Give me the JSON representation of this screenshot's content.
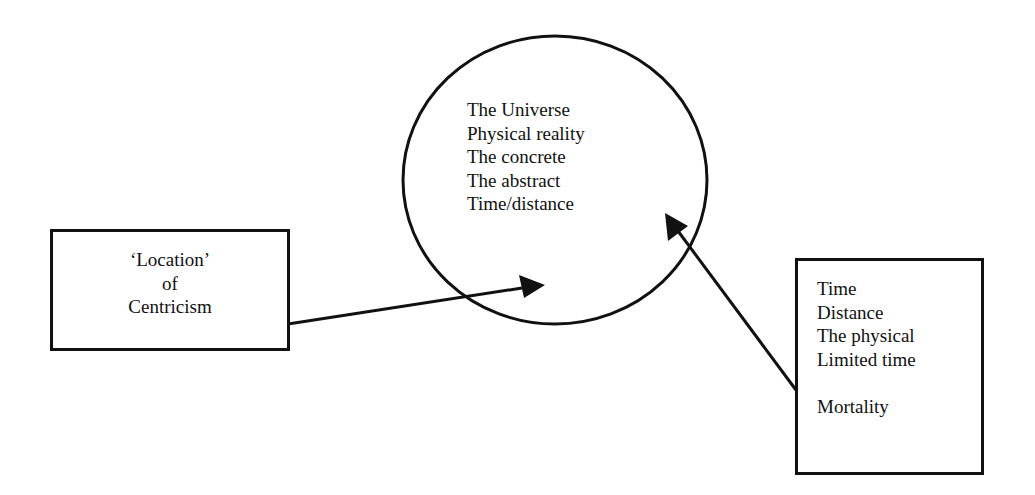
{
  "diagram": {
    "central_circle": {
      "shape": "ellipse",
      "center": [
        555,
        180
      ],
      "radii": [
        152,
        144
      ],
      "lines": [
        "The Universe",
        "Physical reality",
        "The concrete",
        "The abstract",
        "Time/distance"
      ]
    },
    "left_box": {
      "lines": [
        "‘Location’",
        "of",
        "Centricism"
      ]
    },
    "right_box": {
      "lines": [
        "Time",
        "Distance",
        "The physical",
        "Limited time",
        "",
        "Mortality"
      ]
    },
    "arrows": [
      {
        "from": "left_box",
        "to": "central_circle",
        "start": [
          288,
          324
        ],
        "end": [
          545,
          285
        ]
      },
      {
        "from": "right_box",
        "to": "central_circle",
        "start": [
          796,
          390
        ],
        "end": [
          665,
          213
        ]
      }
    ],
    "colors": {
      "stroke": "#111111",
      "background": "#ffffff"
    }
  }
}
